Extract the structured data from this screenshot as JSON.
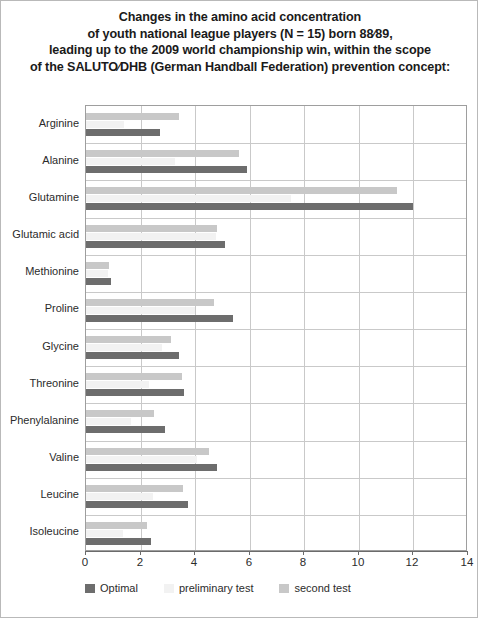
{
  "chart_data": {
    "type": "bar",
    "orientation": "horizontal",
    "title_lines": [
      "Changes in the amino acid concentration",
      "of youth national league players (N = 15) born 88⁄89,",
      "leading up to the 2009 world championship win, within the scope",
      "of the SALUTO⁄DHB (German Handball Federation) prevention concept:"
    ],
    "xlabel": "",
    "ylabel": "",
    "xlim": [
      0,
      14
    ],
    "xticks": [
      0,
      2,
      4,
      6,
      8,
      10,
      12,
      14
    ],
    "xtick_labels": [
      "0",
      "2",
      "4",
      "6",
      "8",
      "10",
      "12",
      "14"
    ],
    "grid": true,
    "grid_axis": "x",
    "legend_position": "bottom-left",
    "categories": [
      "Arginine",
      "Alanine",
      "Glutamine",
      "Glutamic acid",
      "Methionine",
      "Proline",
      "Glycine",
      "Threonine",
      "Phenylalanine",
      "Valine",
      "Leucine",
      "Isoleucine"
    ],
    "series": [
      {
        "name": "Optimal",
        "color": "#6d6d6d",
        "values": [
          2.7,
          5.9,
          12.0,
          5.1,
          0.9,
          5.4,
          3.4,
          3.6,
          2.9,
          4.8,
          3.75,
          2.4
        ]
      },
      {
        "name": "preliminary test",
        "color": "#f2f2f2",
        "values": [
          1.4,
          3.25,
          7.5,
          4.75,
          0.8,
          4.0,
          2.8,
          2.3,
          1.65,
          4.05,
          2.45,
          1.35
        ]
      },
      {
        "name": "second test",
        "color": "#c8c8c8",
        "values": [
          3.4,
          5.6,
          11.4,
          4.8,
          0.85,
          4.7,
          3.1,
          3.5,
          2.5,
          4.5,
          3.55,
          2.25
        ]
      }
    ]
  }
}
